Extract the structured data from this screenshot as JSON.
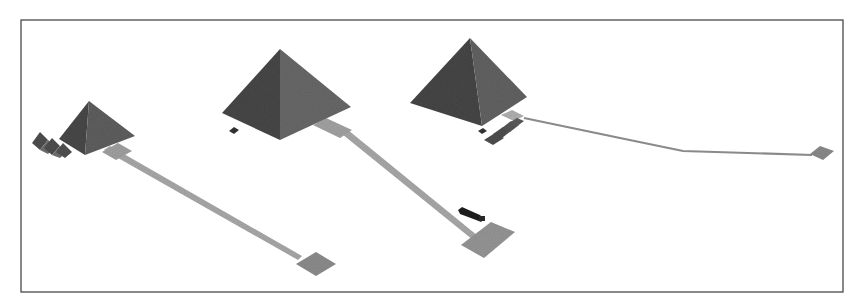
{
  "figure": {
    "text_labels": [],
    "colors": {
      "background": "#ffffff",
      "frame": "#3a3a3a",
      "pyramid_dark_face": "#4a4a4a",
      "pyramid_light_face": "#707070",
      "causeway": "#a8a8a8",
      "temple": "#8f8f8f",
      "sphinx": "#1e1e1e"
    }
  },
  "monuments": [
    {
      "id": "menkaure",
      "name": "Smaller pyramid (left)",
      "has_satellite_pyramids": true,
      "has_causeway": true,
      "has_valley_temple": true
    },
    {
      "id": "khafre",
      "name": "Middle pyramid",
      "has_causeway": true,
      "has_valley_temple": true,
      "has_sphinx": true
    },
    {
      "id": "khufu",
      "name": "Large pyramid (right)",
      "has_causeway": true,
      "has_valley_temple": true,
      "has_boat_pits_temples": true
    }
  ]
}
